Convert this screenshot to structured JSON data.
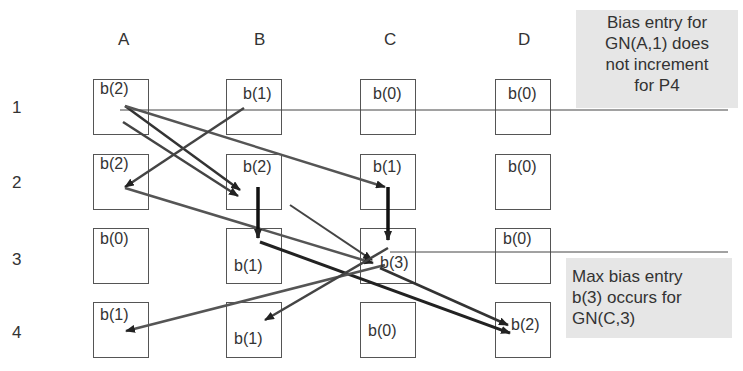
{
  "columns": [
    "A",
    "B",
    "C",
    "D"
  ],
  "rows": [
    "1",
    "2",
    "3",
    "4"
  ],
  "cells": {
    "A1": "b(2)",
    "B1": "b(1)",
    "C1": "b(0)",
    "D1": "b(0)",
    "A2": "b(2)",
    "B2": "b(2)",
    "C2": "b(1)",
    "D2": "b(0)",
    "A3": "b(0)",
    "B3": "b(1)",
    "C3": "b(3)",
    "D3": "b(0)",
    "A4": "b(1)",
    "B4": "b(1)",
    "C4": "b(0)",
    "D4": "b(2)"
  },
  "notes": {
    "top": [
      "Bias entry for",
      "GN(A,1) does",
      "not increment",
      "for P4"
    ],
    "bottom": [
      "Max bias entry",
      "b(3) occurs for",
      "GN(C,3)"
    ]
  }
}
